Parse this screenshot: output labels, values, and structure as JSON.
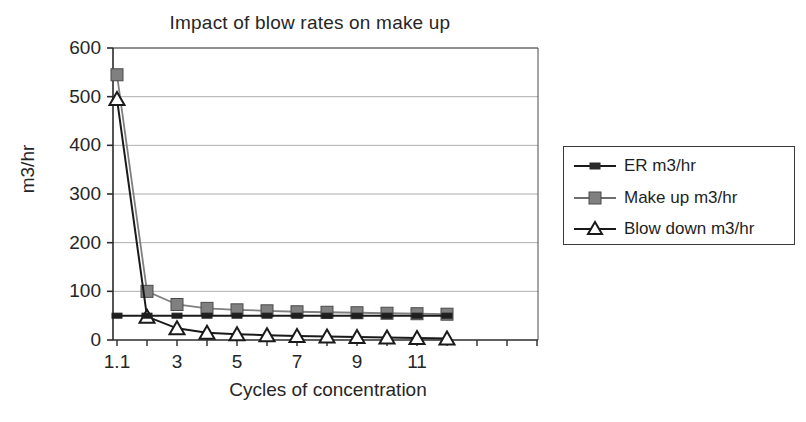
{
  "chart_data": {
    "type": "line",
    "title": "Impact of blow rates on make up",
    "xlabel": "Cycles of concentration",
    "ylabel": "m3/hr",
    "grid": true,
    "legend_position": "right",
    "ylim": [
      0,
      600
    ],
    "ytick_labels": [
      "0",
      "100",
      "200",
      "300",
      "400",
      "500",
      "600"
    ],
    "ytick_values": [
      0,
      100,
      200,
      300,
      400,
      500,
      600
    ],
    "x": [
      1.1,
      2,
      3,
      4,
      5,
      6,
      7,
      8,
      9,
      10,
      11,
      12
    ],
    "categories": [
      "1.1",
      "2",
      "3",
      "4",
      "5",
      "6",
      "7",
      "8",
      "9",
      "10",
      "11",
      "12"
    ],
    "xtick_labels": [
      "1.1",
      "3",
      "5",
      "7",
      "9",
      "11"
    ],
    "xtick_label_values": [
      1.1,
      3,
      5,
      7,
      9,
      11
    ],
    "series": [
      {
        "name": "ER m3/hr",
        "color": "#1a1a1a",
        "marker": "small-square",
        "values": [
          50,
          50,
          50,
          50,
          50,
          50,
          50,
          50,
          50,
          50,
          50,
          50
        ]
      },
      {
        "name": "Make up m3/hr",
        "color": "#808080",
        "marker": "square",
        "values": [
          545,
          100,
          73,
          65,
          62,
          60,
          58,
          57,
          56,
          55,
          54,
          53
        ]
      },
      {
        "name": "Blow down m3/hr",
        "color": "#1a1a1a",
        "marker": "triangle",
        "values": [
          495,
          48,
          24,
          15,
          12,
          10,
          8,
          7,
          6,
          5,
          4,
          3
        ]
      }
    ]
  },
  "legend": {
    "entries": [
      {
        "label": "ER m3/hr"
      },
      {
        "label": "Make up m3/hr"
      },
      {
        "label": "Blow down m3/hr"
      }
    ]
  }
}
